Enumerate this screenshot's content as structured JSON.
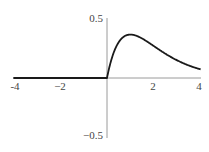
{
  "chart_data": {
    "type": "line",
    "title": "",
    "xlabel": "",
    "ylabel": "",
    "xlim": [
      -4,
      4
    ],
    "ylim": [
      -0.5,
      0.5
    ],
    "grid": false,
    "legend": null,
    "x_ticks": [
      {
        "value": -4,
        "label": "-4"
      },
      {
        "value": -2,
        "label": "−2"
      },
      {
        "value": 2,
        "label": "2"
      },
      {
        "value": 4,
        "label": "4"
      }
    ],
    "y_ticks": [
      {
        "value": 0.5,
        "label": "0.5"
      },
      {
        "value": -0.5,
        "label": "−0.5"
      }
    ],
    "series": [
      {
        "name": "f(x)",
        "color": "#1a1a1a",
        "x": [
          -4,
          -3,
          -2,
          -1,
          0,
          0.1,
          0.2,
          0.3,
          0.5,
          0.75,
          1.0,
          1.25,
          1.5,
          2.0,
          2.5,
          3.0,
          3.5,
          4.0
        ],
        "y": [
          0,
          0,
          0,
          0,
          0,
          0.09,
          0.164,
          0.222,
          0.303,
          0.354,
          0.368,
          0.358,
          0.335,
          0.271,
          0.205,
          0.149,
          0.106,
          0.073
        ]
      }
    ]
  },
  "colors": {
    "axis": "#9a9a9a",
    "curve": "#1a1a1a",
    "label": "#444444"
  }
}
